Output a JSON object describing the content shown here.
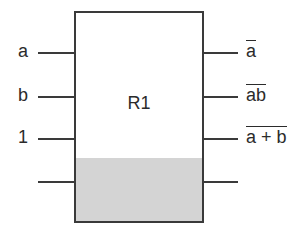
{
  "diagram": {
    "type": "logic-block",
    "block": {
      "label": "R1",
      "shaded_bottom_section": true,
      "shade_color": "#d4d4d4",
      "border_color": "#3a3a3a"
    },
    "inputs": [
      {
        "label": "a"
      },
      {
        "label": "b"
      },
      {
        "label": "1"
      },
      {
        "label": ""
      }
    ],
    "outputs": [
      {
        "label": "a",
        "overline": true,
        "display": "NOT a"
      },
      {
        "label": "ab",
        "overline": true,
        "display": "NOT (a AND b)"
      },
      {
        "label": "a + b",
        "overline": true,
        "display": "NOT (a OR b)"
      },
      {
        "label": "",
        "overline": false
      }
    ]
  }
}
